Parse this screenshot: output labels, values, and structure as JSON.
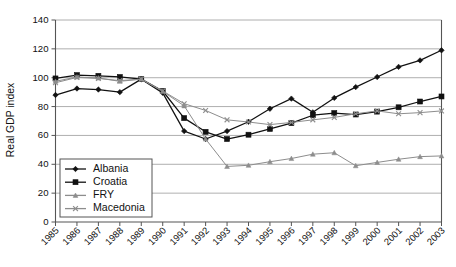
{
  "chart_data": {
    "type": "line",
    "title": "",
    "xlabel": "",
    "ylabel": "Real GDP index",
    "xlim": [
      1985,
      2003
    ],
    "ylim": [
      0,
      140
    ],
    "ytick_step": 20,
    "grid": true,
    "legend_position": "bottom-left",
    "categories": [
      "1985",
      "1986",
      "1987",
      "1988",
      "1989",
      "1990",
      "1991",
      "1992",
      "1993",
      "1994",
      "1995",
      "1996",
      "1997",
      "1998",
      "1999",
      "2000",
      "2001",
      "2002",
      "2003"
    ],
    "ytick_labels": [
      "0",
      "20",
      "40",
      "60",
      "80",
      "100",
      "120",
      "140"
    ],
    "series": [
      {
        "name": "Albania",
        "marker": "diamond",
        "color": "#111111",
        "values": [
          88,
          92.5,
          91.8,
          90,
          99,
          89.5,
          63,
          57.5,
          63,
          69.5,
          78.5,
          85.5,
          76,
          86,
          93.5,
          100.5,
          107.5,
          112,
          119
        ]
      },
      {
        "name": "Croatia",
        "marker": "square",
        "color": "#111111",
        "values": [
          99.5,
          101.8,
          101.3,
          100.5,
          99,
          90.8,
          72,
          62.5,
          57.5,
          60.5,
          64.5,
          68.5,
          74,
          75.5,
          74.5,
          76.5,
          79.5,
          83.5,
          87
        ]
      },
      {
        "name": "FRY",
        "marker": "triangle",
        "color": "#8d8d8d",
        "values": [
          97.5,
          100.5,
          99.8,
          97.5,
          99,
          90.5,
          80.5,
          57.5,
          38.5,
          39.3,
          41.8,
          44,
          47,
          48,
          39,
          41.3,
          43.5,
          45.3,
          45.8
        ]
      },
      {
        "name": "Macedonia",
        "marker": "x",
        "color": "#8d8d8d",
        "values": [
          96.5,
          100.2,
          99.5,
          98,
          99,
          90.8,
          82,
          77.3,
          70.8,
          69.3,
          67.5,
          69,
          70.8,
          72.5,
          75,
          77,
          75,
          75.8,
          77
        ]
      }
    ]
  },
  "legend": {
    "entries": [
      "Albania",
      "Croatia",
      "FRY",
      "Macedonia"
    ]
  }
}
